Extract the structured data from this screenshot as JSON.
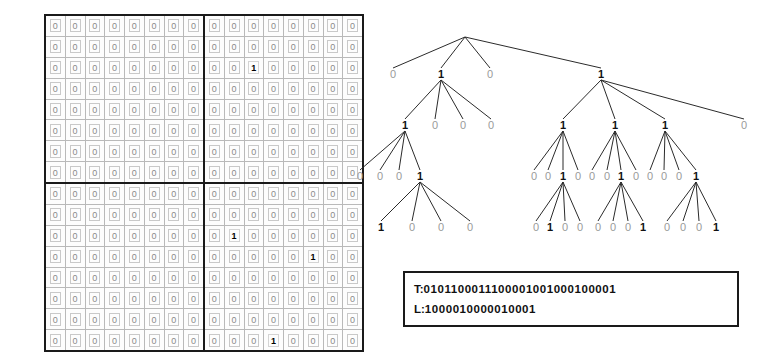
{
  "figure": {
    "grid_size": 16,
    "colors": {
      "ink": "#111111",
      "zero_gray": "#9a9a9a",
      "rule": "#1a1a1a"
    }
  },
  "matrix": {
    "name": "binary-adjacency-matrix",
    "rows": 16,
    "cols": 16,
    "zero_char": "0",
    "one_char": "1",
    "ones": [
      {
        "row": 2,
        "col": 10
      },
      {
        "row": 10,
        "col": 9
      },
      {
        "row": 11,
        "col": 13
      },
      {
        "row": 15,
        "col": 11
      }
    ],
    "cells": [
      [
        "0",
        "0",
        "0",
        "0",
        "0",
        "0",
        "0",
        "0",
        "0",
        "0",
        "0",
        "0",
        "0",
        "0",
        "0",
        "0"
      ],
      [
        "0",
        "0",
        "0",
        "0",
        "0",
        "0",
        "0",
        "0",
        "0",
        "0",
        "0",
        "0",
        "0",
        "0",
        "0",
        "0"
      ],
      [
        "0",
        "0",
        "0",
        "0",
        "0",
        "0",
        "0",
        "0",
        "0",
        "0",
        "1",
        "0",
        "0",
        "0",
        "0",
        "0"
      ],
      [
        "0",
        "0",
        "0",
        "0",
        "0",
        "0",
        "0",
        "0",
        "0",
        "0",
        "0",
        "0",
        "0",
        "0",
        "0",
        "0"
      ],
      [
        "0",
        "0",
        "0",
        "0",
        "0",
        "0",
        "0",
        "0",
        "0",
        "0",
        "0",
        "0",
        "0",
        "0",
        "0",
        "0"
      ],
      [
        "0",
        "0",
        "0",
        "0",
        "0",
        "0",
        "0",
        "0",
        "0",
        "0",
        "0",
        "0",
        "0",
        "0",
        "0",
        "0"
      ],
      [
        "0",
        "0",
        "0",
        "0",
        "0",
        "0",
        "0",
        "0",
        "0",
        "0",
        "0",
        "0",
        "0",
        "0",
        "0",
        "0"
      ],
      [
        "0",
        "0",
        "0",
        "0",
        "0",
        "0",
        "0",
        "0",
        "0",
        "0",
        "0",
        "0",
        "0",
        "0",
        "0",
        "0"
      ],
      [
        "0",
        "0",
        "0",
        "0",
        "0",
        "0",
        "0",
        "0",
        "0",
        "0",
        "0",
        "0",
        "0",
        "0",
        "0",
        "0"
      ],
      [
        "0",
        "0",
        "0",
        "0",
        "0",
        "0",
        "0",
        "0",
        "0",
        "0",
        "0",
        "0",
        "0",
        "0",
        "0",
        "0"
      ],
      [
        "0",
        "0",
        "0",
        "0",
        "0",
        "0",
        "0",
        "0",
        "0",
        "1",
        "0",
        "0",
        "0",
        "0",
        "0",
        "0"
      ],
      [
        "0",
        "0",
        "0",
        "0",
        "0",
        "0",
        "0",
        "0",
        "0",
        "0",
        "0",
        "0",
        "0",
        "1",
        "0",
        "0"
      ],
      [
        "0",
        "0",
        "0",
        "0",
        "0",
        "0",
        "0",
        "0",
        "0",
        "0",
        "0",
        "0",
        "0",
        "0",
        "0",
        "0"
      ],
      [
        "0",
        "0",
        "0",
        "0",
        "0",
        "0",
        "0",
        "0",
        "0",
        "0",
        "0",
        "0",
        "0",
        "0",
        "0",
        "0"
      ],
      [
        "0",
        "0",
        "0",
        "0",
        "0",
        "0",
        "0",
        "0",
        "0",
        "0",
        "0",
        "0",
        "0",
        "0",
        "0",
        "0"
      ],
      [
        "0",
        "0",
        "0",
        "0",
        "0",
        "0",
        "0",
        "0",
        "0",
        "0",
        "0",
        "1",
        "0",
        "0",
        "0",
        "0"
      ]
    ]
  },
  "tree": {
    "name": "k2-quadtree",
    "root": {
      "x": 113,
      "y": 26
    },
    "levels": [
      {
        "level": 1,
        "nodes": [
          {
            "label": "0",
            "x": 41,
            "y": 66
          },
          {
            "label": "1",
            "x": 89,
            "y": 66
          },
          {
            "label": "0",
            "x": 138,
            "y": 66
          },
          {
            "label": "1",
            "x": 249,
            "y": 66
          }
        ]
      },
      {
        "level": 2,
        "nodes": [
          {
            "label": "1",
            "x": 53,
            "y": 117,
            "parent": 1
          },
          {
            "label": "0",
            "x": 83,
            "y": 117,
            "parent": 1
          },
          {
            "label": "0",
            "x": 111,
            "y": 117,
            "parent": 1
          },
          {
            "label": "0",
            "x": 139,
            "y": 117,
            "parent": 1
          },
          {
            "label": "1",
            "x": 211,
            "y": 117,
            "parent": 3
          },
          {
            "label": "1",
            "x": 263,
            "y": 117,
            "parent": 3
          },
          {
            "label": "1",
            "x": 313,
            "y": 117,
            "parent": 3
          },
          {
            "label": "0",
            "x": 392,
            "y": 117,
            "parent": 3
          }
        ]
      },
      {
        "level": 3,
        "nodes": [
          {
            "label": "0",
            "x": 8,
            "y": 168,
            "parent": 0
          },
          {
            "label": "0",
            "x": 28,
            "y": 168,
            "parent": 0
          },
          {
            "label": "0",
            "x": 47,
            "y": 168,
            "parent": 0
          },
          {
            "label": "1",
            "x": 68,
            "y": 168,
            "parent": 0
          },
          {
            "label": "0",
            "x": 182,
            "y": 168,
            "parent": 4
          },
          {
            "label": "0",
            "x": 196,
            "y": 168,
            "parent": 4
          },
          {
            "label": "1",
            "x": 211,
            "y": 168,
            "parent": 4
          },
          {
            "label": "0",
            "x": 226,
            "y": 168,
            "parent": 4
          },
          {
            "label": "0",
            "x": 240,
            "y": 168,
            "parent": 5
          },
          {
            "label": "0",
            "x": 255,
            "y": 168,
            "parent": 5
          },
          {
            "label": "1",
            "x": 269,
            "y": 168,
            "parent": 5
          },
          {
            "label": "0",
            "x": 284,
            "y": 168,
            "parent": 5
          },
          {
            "label": "0",
            "x": 298,
            "y": 168,
            "parent": 6
          },
          {
            "label": "0",
            "x": 312,
            "y": 168,
            "parent": 6
          },
          {
            "label": "0",
            "x": 327,
            "y": 168,
            "parent": 6
          },
          {
            "label": "1",
            "x": 344,
            "y": 168,
            "parent": 6
          }
        ]
      },
      {
        "level": 4,
        "nodes": [
          {
            "label": "1",
            "x": 29,
            "y": 219,
            "parent": 3
          },
          {
            "label": "0",
            "x": 60,
            "y": 219,
            "parent": 3
          },
          {
            "label": "0",
            "x": 89,
            "y": 219,
            "parent": 3
          },
          {
            "label": "0",
            "x": 118,
            "y": 219,
            "parent": 3
          },
          {
            "label": "0",
            "x": 184,
            "y": 219,
            "parent": 6
          },
          {
            "label": "1",
            "x": 198,
            "y": 219,
            "parent": 6
          },
          {
            "label": "0",
            "x": 213,
            "y": 219,
            "parent": 6
          },
          {
            "label": "0",
            "x": 228,
            "y": 219,
            "parent": 6
          },
          {
            "label": "0",
            "x": 246,
            "y": 219,
            "parent": 10
          },
          {
            "label": "0",
            "x": 261,
            "y": 219,
            "parent": 10
          },
          {
            "label": "0",
            "x": 276,
            "y": 219,
            "parent": 10
          },
          {
            "label": "1",
            "x": 291,
            "y": 219,
            "parent": 10
          },
          {
            "label": "0",
            "x": 315,
            "y": 219,
            "parent": 15
          },
          {
            "label": "0",
            "x": 331,
            "y": 219,
            "parent": 15
          },
          {
            "label": "0",
            "x": 347,
            "y": 219,
            "parent": 15
          },
          {
            "label": "1",
            "x": 364,
            "y": 219,
            "parent": 15
          }
        ]
      }
    ]
  },
  "bitstrings": {
    "name": "louds-bitstrings",
    "t_label": "T:",
    "t_value": "0101100011100001001000100001",
    "l_label": "L:",
    "l_value": "1000010000010001"
  }
}
